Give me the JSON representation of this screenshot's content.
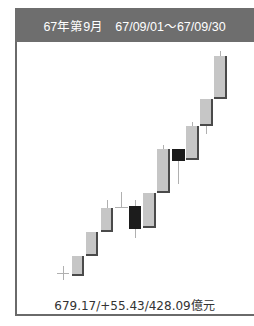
{
  "header": {
    "title": "67年第9月",
    "date_range": "67/09/01～67/09/30"
  },
  "footer": {
    "summary": "679.17/+55.43/428.09億元"
  },
  "colors": {
    "header_bg": "#6e6e6e",
    "up_body": "#c6c6c6",
    "up_shadow": "#4a4a4a",
    "down_body": "#1c1c1c",
    "wick": "#b0b0b0"
  },
  "chart_data": {
    "type": "candlestick",
    "title": "67年第9月 67/09/01～67/09/30",
    "period": "67/09/01～67/09/30",
    "summary": {
      "close": 679.17,
      "change": 55.43,
      "volume": 428.09,
      "volume_unit": "億元"
    },
    "xlabel": "",
    "ylabel": "",
    "grid": false,
    "candles": [
      {
        "idx": 1,
        "type": "doji",
        "open": 623.7,
        "close": 623.7,
        "high": 625.5,
        "low": 622.0,
        "x": 57,
        "w": 12,
        "bt": 273,
        "bb": 273,
        "wt": 266,
        "wb": 280
      },
      {
        "idx": 2,
        "type": "up",
        "open": 623.2,
        "close": 628.3,
        "high": 628.3,
        "low": 623.2,
        "x": 72,
        "w": 12,
        "bt": 256,
        "bb": 276,
        "wt": 256,
        "wb": 276
      },
      {
        "idx": 3,
        "type": "up",
        "open": 628.3,
        "close": 634.4,
        "high": 634.4,
        "low": 628.3,
        "x": 86,
        "w": 12,
        "bt": 232,
        "bb": 256,
        "wt": 232,
        "wb": 256
      },
      {
        "idx": 4,
        "type": "up",
        "open": 634.4,
        "close": 640.5,
        "high": 642.6,
        "low": 634.4,
        "x": 101,
        "w": 12,
        "bt": 208,
        "bb": 232,
        "wt": 200,
        "wb": 232
      },
      {
        "idx": 5,
        "type": "doji",
        "open": 640.8,
        "close": 640.8,
        "high": 644.6,
        "low": 640.8,
        "x": 115,
        "w": 13,
        "bt": 207,
        "bb": 207,
        "wt": 192,
        "wb": 207
      },
      {
        "idx": 6,
        "type": "down",
        "open": 641.0,
        "close": 635.2,
        "high": 642.6,
        "low": 632.9,
        "x": 129,
        "w": 12,
        "bt": 206,
        "bb": 229,
        "wt": 200,
        "wb": 238
      },
      {
        "idx": 7,
        "type": "up",
        "open": 635.4,
        "close": 644.2,
        "high": 644.2,
        "low": 635.4,
        "x": 143,
        "w": 13,
        "bt": 193,
        "bb": 228,
        "wt": 193,
        "wb": 228
      },
      {
        "idx": 8,
        "type": "up",
        "open": 644.2,
        "close": 655.4,
        "high": 656.4,
        "low": 644.2,
        "x": 157,
        "w": 13,
        "bt": 149,
        "bb": 193,
        "wt": 145,
        "wb": 193
      },
      {
        "idx": 9,
        "type": "down",
        "open": 655.4,
        "close": 652.3,
        "high": 655.4,
        "low": 646.6,
        "x": 172,
        "w": 13,
        "bt": 149,
        "bb": 161,
        "wt": 149,
        "wb": 184
      },
      {
        "idx": 10,
        "type": "up",
        "open": 652.6,
        "close": 661.3,
        "high": 662.3,
        "low": 652.6,
        "x": 186,
        "w": 13,
        "bt": 126,
        "bb": 160,
        "wt": 122,
        "wb": 160
      },
      {
        "idx": 11,
        "type": "up",
        "open": 661.3,
        "close": 668.2,
        "high": 668.2,
        "low": 659.2,
        "x": 200,
        "w": 13,
        "bt": 99,
        "bb": 126,
        "wt": 99,
        "wb": 134
      },
      {
        "idx": 12,
        "type": "up",
        "open": 668.2,
        "close": 679.2,
        "high": 680.4,
        "low": 668.2,
        "x": 214,
        "w": 13,
        "bt": 56,
        "bb": 99,
        "wt": 51,
        "wb": 99
      }
    ]
  }
}
